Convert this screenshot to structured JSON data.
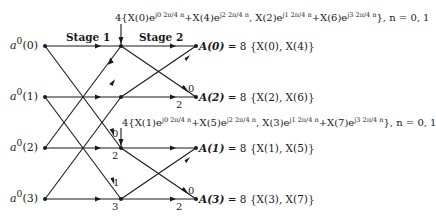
{
  "diagram": {
    "type": "butterfly-flow-graph",
    "stages": [
      "Stage 1",
      "Stage 2"
    ],
    "inputs": [
      {
        "label_base": "a",
        "label_sup": "0",
        "label_idx": "(0)"
      },
      {
        "label_base": "a",
        "label_sup": "0",
        "label_idx": "(1)"
      },
      {
        "label_base": "a",
        "label_sup": "0",
        "label_idx": "(2)"
      },
      {
        "label_base": "a",
        "label_sup": "0",
        "label_idx": "(3)"
      }
    ],
    "outputs": [
      {
        "name": "A(0)",
        "eq": "= 8 {X(0), X(4)}"
      },
      {
        "name": "A(2)",
        "eq": "= 8 {X(2), X(6)}"
      },
      {
        "name": "A(1)",
        "eq": "= 8 {X(1), X(5)}"
      },
      {
        "name": "A(3)",
        "eq": "= 8 {X(3), X(7)}"
      }
    ],
    "twiddle_labels": {
      "stage1": [
        "0",
        "2",
        "1",
        "3"
      ],
      "stage2": [
        "0",
        "2",
        "0",
        "2"
      ]
    },
    "annotations": [
      {
        "text_a": "4{X(0)e",
        "exp1": "j0 2π/4 n",
        "text_b": "+X(4)e",
        "exp2": "j2 2π/4 n",
        "text_c": ", X(2)e",
        "exp3": "j1 2π/4 n",
        "text_d": "+X(6)e",
        "exp4": "j3 2π/4 n",
        "text_e": "},  n = 0, 1"
      },
      {
        "text_a": "4{X(1)e",
        "exp1": "j0 2π/4 n",
        "text_b": "+X(5)e",
        "exp2": "j2 2π/4 n",
        "text_c": ", X(3)e",
        "exp3": "j1 2π/4 n",
        "text_d": "+X(7)e",
        "exp4": "j3 2π/4 n",
        "text_e": "},  n = 0, 1"
      }
    ]
  }
}
